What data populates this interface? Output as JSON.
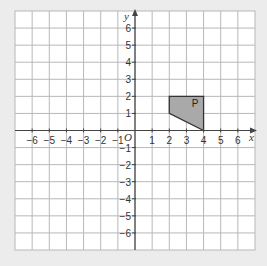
{
  "chart_data": {
    "type": "coordinate-grid",
    "title": "",
    "xlabel": "x",
    "ylabel": "y",
    "origin_label": "O",
    "xlim": [
      -7,
      7
    ],
    "ylim": [
      -7,
      7
    ],
    "grid": true,
    "x_ticks": [
      -6,
      -5,
      -4,
      -3,
      -2,
      -1,
      1,
      2,
      3,
      4,
      5,
      6
    ],
    "y_ticks": [
      -6,
      -5,
      -4,
      -3,
      -2,
      -1,
      1,
      2,
      3,
      4,
      5,
      6
    ],
    "shapes": [
      {
        "label": "P",
        "vertices": [
          [
            2,
            2
          ],
          [
            4,
            2
          ],
          [
            4,
            0
          ],
          [
            2,
            1
          ]
        ],
        "fill": "#a9a9a9",
        "stroke": "#333333",
        "label_position": [
          3.5,
          1.6
        ]
      }
    ]
  },
  "colors": {
    "background": "#ececec",
    "grid_bg": "#ffffff",
    "grid_line": "#b8b8b8",
    "axis": "#444444"
  }
}
